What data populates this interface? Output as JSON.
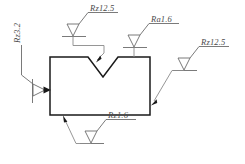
{
  "drawing": {
    "title": "Surface roughness symbols on V-notched block",
    "background_color": "#ffffff",
    "outline_color": "#1a1a1a",
    "symbol_color": "#6b6b6b",
    "leader_color": "#8a8a8a",
    "text_color": "#4a4a4a"
  },
  "annotations": [
    {
      "id": "top-left",
      "parameter": "Rz",
      "value": "12.5",
      "label": "Rz12.5",
      "target": "v-notch-left-face"
    },
    {
      "id": "top-right",
      "parameter": "Ra",
      "value": "1.6",
      "label": "Ra1.6",
      "target": "top-face"
    },
    {
      "id": "right",
      "parameter": "Rz",
      "value": "12.5",
      "label": "Rz12.5",
      "target": "right-face"
    },
    {
      "id": "bottom",
      "parameter": "Rz",
      "value": "1.6",
      "label": "Rz1.6",
      "target": "bottom-face"
    },
    {
      "id": "left",
      "parameter": "Rz",
      "value": "3.2",
      "label": "Rz3.2",
      "target": "left-face",
      "orientation": "rotated-vertical"
    }
  ]
}
